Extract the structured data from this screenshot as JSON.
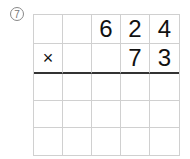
{
  "problem": {
    "number_label": "7",
    "operator": "×",
    "multiplicand_digits": [
      "",
      "",
      "6",
      "2",
      "4"
    ],
    "multiplier_digits": [
      "×",
      "",
      "",
      "7",
      "3"
    ],
    "answer_rows": [
      [
        "",
        "",
        "",
        "",
        ""
      ],
      [
        "",
        "",
        "",
        "",
        ""
      ],
      [
        "",
        "",
        "",
        "",
        ""
      ]
    ]
  }
}
